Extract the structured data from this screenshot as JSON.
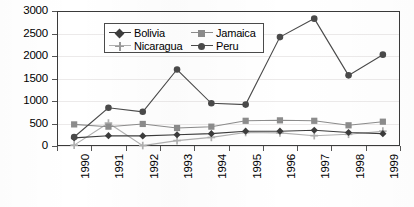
{
  "chart_data": {
    "type": "line",
    "title": "",
    "subtitle": "",
    "xlabel": "",
    "ylabel": "",
    "categories": [
      "1990",
      "1991",
      "1992",
      "1993",
      "1994",
      "1995",
      "1996",
      "1997",
      "1998",
      "1999"
    ],
    "ylim": [
      0,
      3000
    ],
    "yticks": [
      0,
      500,
      1000,
      1500,
      2000,
      2500,
      3000
    ],
    "ytick_labels": [
      "0",
      "500",
      "1000",
      "1500",
      "2000",
      "2500",
      "3000"
    ],
    "grid": true,
    "legend_position": "top-left-inside",
    "series": [
      {
        "name": "Bolivia",
        "marker": "diamond",
        "color": "#3c3c3c",
        "values": [
          180,
          230,
          225,
          250,
          275,
          330,
          330,
          350,
          300,
          275
        ]
      },
      {
        "name": "Jamaica",
        "marker": "square",
        "color": "#8c8c8c",
        "values": [
          480,
          430,
          490,
          400,
          430,
          560,
          570,
          560,
          460,
          540
        ]
      },
      {
        "name": "Nicaragua",
        "marker": "plus",
        "color": "#b0b0b0",
        "values": [
          20,
          510,
          10,
          120,
          190,
          300,
          290,
          230,
          260,
          330
        ]
      },
      {
        "name": "Peru",
        "marker": "circle",
        "color": "#4a4a4a",
        "values": [
          200,
          850,
          760,
          1700,
          950,
          920,
          2420,
          2830,
          1570,
          2030
        ]
      }
    ]
  },
  "legend": {
    "items": [
      {
        "label": "Bolivia",
        "marker": "diamond-marker",
        "color": "#3c3c3c"
      },
      {
        "label": "Jamaica",
        "marker": "square-marker",
        "color": "#8c8c8c"
      },
      {
        "label": "Nicaragua",
        "marker": "plus-marker",
        "color": "#b0b0b0"
      },
      {
        "label": "Peru",
        "marker": "circle-marker",
        "color": "#4a4a4a"
      }
    ]
  },
  "colors": {
    "frame": "#3a3a3a",
    "grid": "#eceaea",
    "background": "#ffffff",
    "text": "#000000"
  }
}
